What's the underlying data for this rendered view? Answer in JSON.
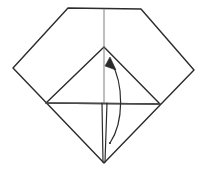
{
  "figure": {
    "canvas": {
      "width": 207,
      "height": 177,
      "background": "#ffffff"
    },
    "colors": {
      "stroke": "#2b2b2b",
      "stroke_light": "#4a4a4a",
      "crease": "#6f6f6f",
      "background": "#ffffff",
      "arrow": "#2b2b2b"
    },
    "stroke_widths": {
      "outline": 1.4,
      "inner": 1.4,
      "crease": 0.9,
      "arrow": 1.2,
      "flap": 1.2
    },
    "shapes": {
      "outline": {
        "name": "paper-outline",
        "points": "68,8 141,9 194,70 104,163 13,68"
      },
      "inner_triangle": {
        "name": "inner-triangle",
        "points": "104,47 160,104 46,103"
      },
      "vertical_crease_top": {
        "name": "vertical-crease-top",
        "x1": 104,
        "y1": 9,
        "x2": 104,
        "y2": 47
      },
      "vertical_crease_mid": {
        "name": "vertical-crease-middle",
        "x1": 104,
        "y1": 47,
        "x2": 104,
        "y2": 103
      },
      "horizontal_crease": {
        "name": "horizontal-crease",
        "x1": 46,
        "y1": 103,
        "x2": 160,
        "y2": 104
      },
      "flap_left_edge": {
        "name": "flap-left-edge",
        "x1": 102,
        "y1": 103,
        "x2": 103,
        "y2": 162
      },
      "flap_right_edge": {
        "name": "flap-right-edge",
        "x1": 107,
        "y1": 103,
        "x2": 105,
        "y2": 162
      },
      "arrow_curve": {
        "name": "fold-arrow-curve",
        "path": "M 110 143 C 124 122, 124 84, 111 62"
      },
      "arrow_head": {
        "name": "fold-arrow-head",
        "points": "110,57 116,70 105,66"
      },
      "arrow_tail_dot": {
        "name": "fold-arrow-tail",
        "cx": 110,
        "cy": 143,
        "r": 1.1
      }
    },
    "labels": {
      "caption": ""
    }
  }
}
